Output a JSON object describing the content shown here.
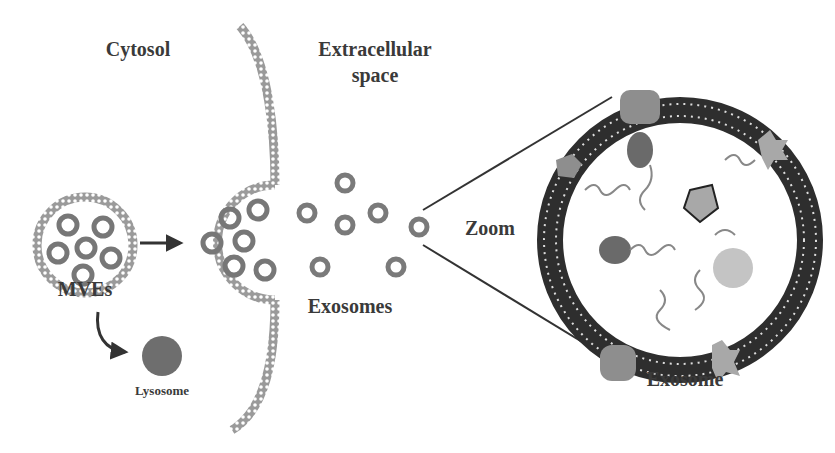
{
  "diagram": {
    "type": "exosome-biogenesis-schematic",
    "labels": {
      "cytosol": "Cytosol",
      "extracellular_line1": "Extracellular",
      "extracellular_line2": "space",
      "mves": "MVEs",
      "lysosome": "Lysosome",
      "exosomes": "Exosomes",
      "zoom": "Zoom",
      "exosome": "Exosome"
    },
    "colors": {
      "text": "#3a3a3a",
      "membrane": "#8a8a8a",
      "bilayer_dark": "#2e2e2e",
      "lysosome": "#6e6e6e",
      "protein_light": "#a8a8a8",
      "protein_dark": "#6a6a6a"
    },
    "nodes": [
      {
        "id": "mve",
        "label_ref": "mves"
      },
      {
        "id": "fusing-mve"
      },
      {
        "id": "plasma-membrane"
      },
      {
        "id": "lysosome",
        "label_ref": "lysosome"
      },
      {
        "id": "exosomes",
        "label_ref": "exosomes",
        "count": 7
      },
      {
        "id": "exosome-zoom",
        "label_ref": "exosome"
      }
    ],
    "edges": [
      {
        "from": "mve",
        "to": "fusing-mve",
        "style": "straight-arrow"
      },
      {
        "from": "mve",
        "to": "lysosome",
        "style": "curved-arrow"
      },
      {
        "from": "exosomes",
        "to": "exosome-zoom",
        "style": "zoom-lines",
        "label_ref": "zoom"
      }
    ]
  }
}
